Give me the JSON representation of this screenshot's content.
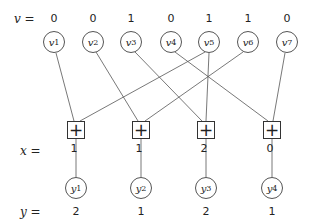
{
  "diagram": {
    "row_labels": {
      "v": "v =",
      "x": "x =",
      "y": "y ="
    },
    "v_nodes": [
      {
        "name": "v",
        "sub": "1",
        "value": "0",
        "cx": 54
      },
      {
        "name": "v",
        "sub": "2",
        "value": "0",
        "cx": 93
      },
      {
        "name": "v",
        "sub": "3",
        "value": "1",
        "cx": 131
      },
      {
        "name": "v",
        "sub": "4",
        "value": "0",
        "cx": 171
      },
      {
        "name": "v",
        "sub": "5",
        "value": "1",
        "cx": 209
      },
      {
        "name": "v",
        "sub": "6",
        "value": "1",
        "cx": 248
      },
      {
        "name": "v",
        "sub": "7",
        "value": "0",
        "cx": 287
      }
    ],
    "sum_nodes": [
      {
        "symbol": "+",
        "value": "1",
        "inputs": [
          "v1",
          "v5"
        ],
        "cx": 76
      },
      {
        "symbol": "+",
        "value": "1",
        "inputs": [
          "v2",
          "v6"
        ],
        "cx": 141
      },
      {
        "symbol": "+",
        "value": "2",
        "inputs": [
          "v3",
          "v5"
        ],
        "cx": 206
      },
      {
        "symbol": "+",
        "value": "0",
        "inputs": [
          "v4",
          "v7"
        ],
        "cx": 272
      }
    ],
    "y_nodes": [
      {
        "name": "y",
        "sub": "1",
        "value": "2"
      },
      {
        "name": "y",
        "sub": "2",
        "value": "1"
      },
      {
        "name": "y",
        "sub": "3",
        "value": "2"
      },
      {
        "name": "y",
        "sub": "4",
        "value": "1"
      }
    ],
    "edges": [
      [
        "v1",
        "x1"
      ],
      [
        "v5",
        "x1"
      ],
      [
        "v2",
        "x2"
      ],
      [
        "v6",
        "x2"
      ],
      [
        "v3",
        "x3"
      ],
      [
        "v5",
        "x3"
      ],
      [
        "v4",
        "x4"
      ],
      [
        "v7",
        "x4"
      ],
      [
        "x1",
        "y1"
      ],
      [
        "x2",
        "y2"
      ],
      [
        "x3",
        "y3"
      ],
      [
        "x4",
        "y4"
      ]
    ]
  }
}
